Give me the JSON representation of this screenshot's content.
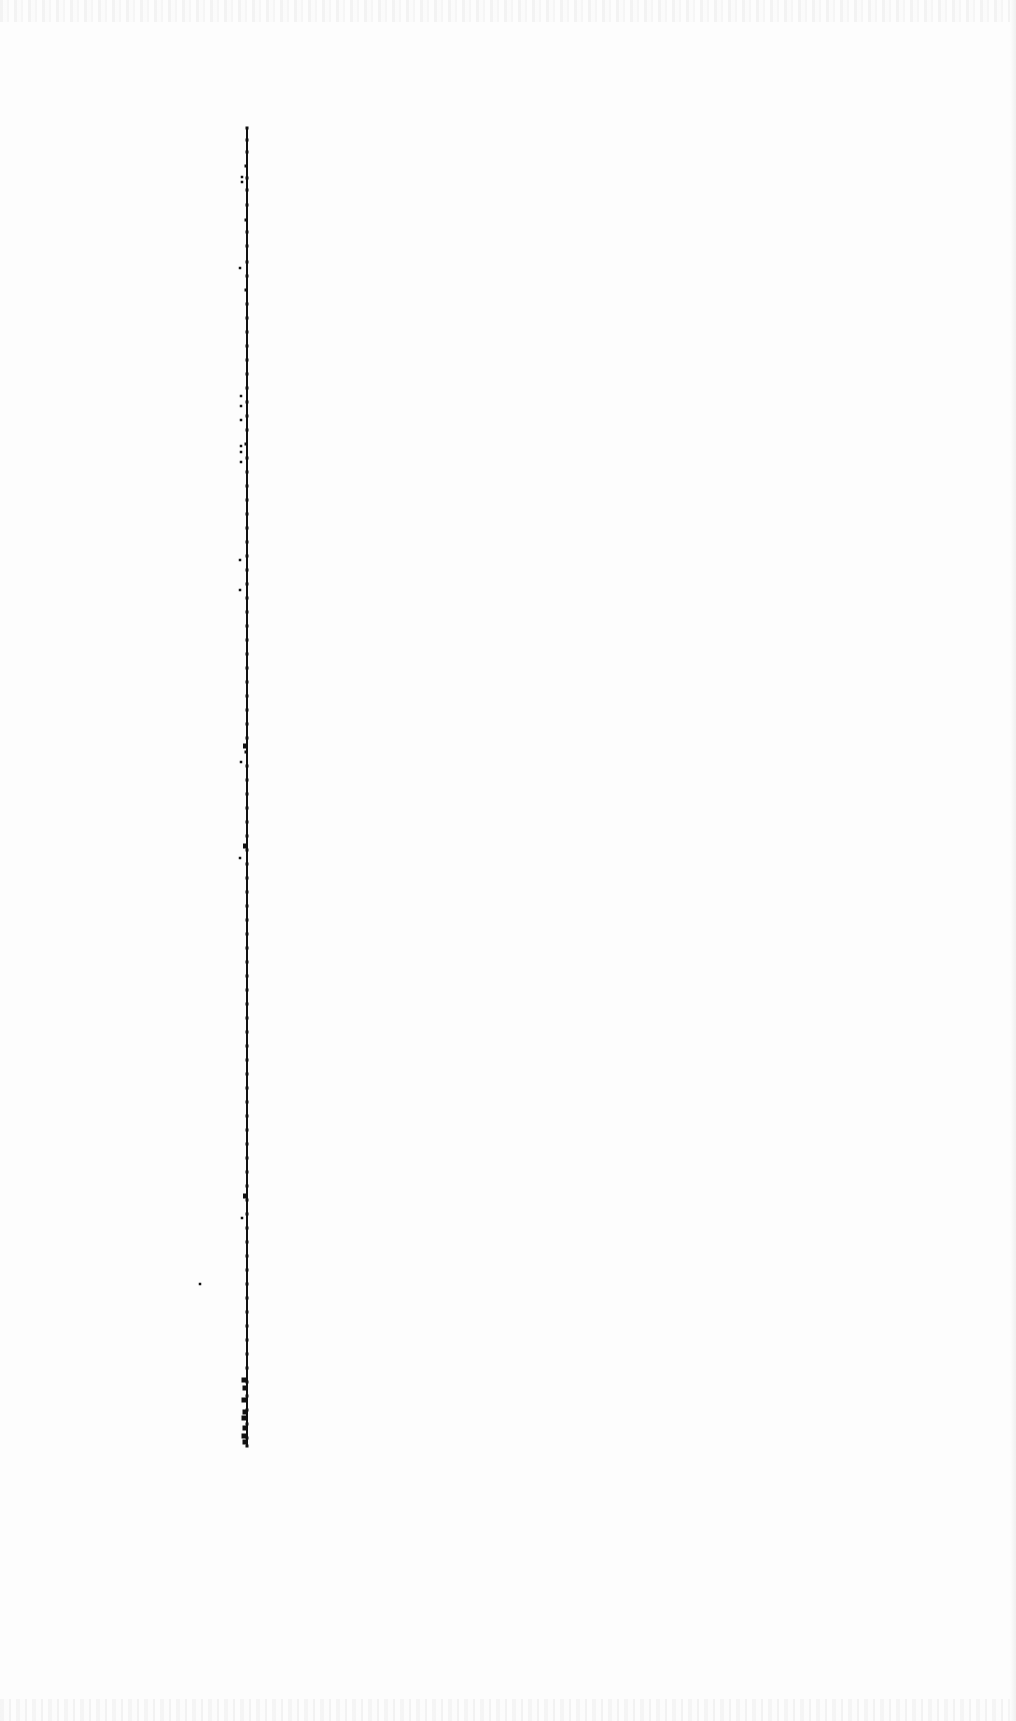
{
  "chart_data": {
    "type": "scatter",
    "title": "",
    "subtitle": "",
    "xlabel": "",
    "ylabel": "",
    "grid": false,
    "legend": null,
    "layout": {
      "strip_x": 247,
      "strip_y_start": 128,
      "strip_y_end": 1446,
      "point_color": "#111111",
      "background": "#fdfdfd"
    },
    "series": [
      {
        "name": "main-strip",
        "description": "dense column of points along a vertical line",
        "points": [
          [
            247,
            128
          ],
          [
            247,
            140
          ],
          [
            247,
            152
          ],
          [
            246,
            166
          ],
          [
            247,
            178
          ],
          [
            247,
            190
          ],
          [
            247,
            205
          ],
          [
            246,
            220
          ],
          [
            247,
            232
          ],
          [
            247,
            246
          ],
          [
            247,
            262
          ],
          [
            247,
            276
          ],
          [
            246,
            290
          ],
          [
            247,
            304
          ],
          [
            247,
            318
          ],
          [
            247,
            332
          ],
          [
            247,
            346
          ],
          [
            247,
            360
          ],
          [
            247,
            374
          ],
          [
            247,
            388
          ],
          [
            247,
            402
          ],
          [
            247,
            416
          ],
          [
            247,
            430
          ],
          [
            246,
            444
          ],
          [
            247,
            458
          ],
          [
            247,
            472
          ],
          [
            247,
            486
          ],
          [
            247,
            500
          ],
          [
            247,
            514
          ],
          [
            247,
            528
          ],
          [
            247,
            542
          ],
          [
            247,
            556
          ],
          [
            247,
            570
          ],
          [
            247,
            584
          ],
          [
            247,
            598
          ],
          [
            247,
            612
          ],
          [
            247,
            626
          ],
          [
            247,
            640
          ],
          [
            247,
            654
          ],
          [
            247,
            668
          ],
          [
            247,
            682
          ],
          [
            247,
            696
          ],
          [
            247,
            710
          ],
          [
            247,
            724
          ],
          [
            247,
            738
          ],
          [
            246,
            752
          ],
          [
            247,
            766
          ],
          [
            247,
            780
          ],
          [
            247,
            794
          ],
          [
            247,
            808
          ],
          [
            247,
            822
          ],
          [
            247,
            836
          ],
          [
            247,
            850
          ],
          [
            247,
            864
          ],
          [
            247,
            878
          ],
          [
            247,
            892
          ],
          [
            247,
            906
          ],
          [
            247,
            920
          ],
          [
            247,
            934
          ],
          [
            247,
            948
          ],
          [
            247,
            962
          ],
          [
            247,
            976
          ],
          [
            247,
            990
          ],
          [
            247,
            1004
          ],
          [
            247,
            1018
          ],
          [
            247,
            1032
          ],
          [
            247,
            1046
          ],
          [
            247,
            1060
          ],
          [
            247,
            1074
          ],
          [
            247,
            1088
          ],
          [
            247,
            1102
          ],
          [
            247,
            1116
          ],
          [
            247,
            1130
          ],
          [
            247,
            1144
          ],
          [
            247,
            1158
          ],
          [
            247,
            1172
          ],
          [
            247,
            1186
          ],
          [
            247,
            1200
          ],
          [
            247,
            1214
          ],
          [
            247,
            1228
          ],
          [
            247,
            1242
          ],
          [
            247,
            1256
          ],
          [
            247,
            1270
          ],
          [
            247,
            1284
          ],
          [
            247,
            1298
          ],
          [
            247,
            1312
          ],
          [
            247,
            1326
          ],
          [
            247,
            1340
          ],
          [
            247,
            1354
          ],
          [
            247,
            1368
          ],
          [
            247,
            1382
          ],
          [
            247,
            1396
          ],
          [
            247,
            1410
          ],
          [
            247,
            1424
          ],
          [
            247,
            1438
          ],
          [
            247,
            1446
          ]
        ]
      },
      {
        "name": "left-outliers",
        "description": "sparse points slightly left of the strip",
        "points": [
          [
            242,
            177
          ],
          [
            242,
            182
          ],
          [
            240,
            268
          ],
          [
            241,
            396
          ],
          [
            241,
            406
          ],
          [
            241,
            420
          ],
          [
            241,
            446
          ],
          [
            241,
            452
          ],
          [
            241,
            462
          ],
          [
            240,
            560
          ],
          [
            240,
            590
          ],
          [
            241,
            762
          ],
          [
            240,
            858
          ],
          [
            242,
            1218
          ],
          [
            200,
            1284
          ]
        ]
      },
      {
        "name": "bottom-cluster",
        "description": "heavier markers near the bottom of the strip",
        "points": [
          [
            244,
            1380
          ],
          [
            245,
            1388
          ],
          [
            244,
            1400
          ],
          [
            245,
            1412
          ],
          [
            244,
            1418
          ],
          [
            245,
            1428
          ],
          [
            244,
            1436
          ],
          [
            245,
            1442
          ]
        ]
      }
    ],
    "emphasis_points": [
      [
        245,
        746
      ],
      [
        245,
        846
      ],
      [
        245,
        1196
      ]
    ]
  }
}
